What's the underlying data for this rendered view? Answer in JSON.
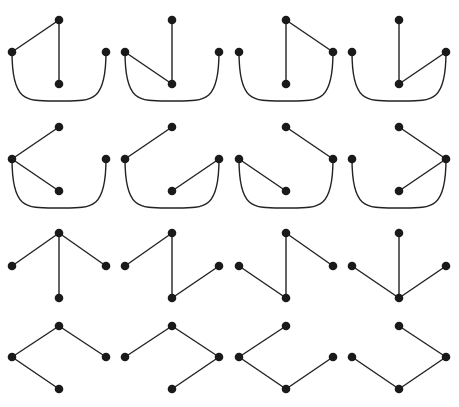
{
  "colors": {
    "edge": "#222222",
    "node": "#1a1a1a",
    "background": "#ffffff"
  },
  "node_radius": 4.3,
  "vertex_labels": [
    "top",
    "left",
    "right",
    "bottom"
  ],
  "panel_offsets_x": [
    0,
    113,
    227,
    340
  ],
  "rows": [
    {
      "y_top": 20,
      "y_side": 52,
      "y_bottom": 84,
      "curve_y": 101
    },
    {
      "y_top": 127,
      "y_side": 159,
      "y_bottom": 191,
      "curve_y": 208
    },
    {
      "y_top": 233,
      "y_side": 266,
      "y_bottom": 298,
      "curve_y": null
    },
    {
      "y_top": 326,
      "y_side": 357,
      "y_bottom": 389,
      "curve_y": null
    }
  ],
  "node_x": {
    "top": 59,
    "left": 12,
    "right": 106,
    "bottom": 59
  },
  "panels": [
    {
      "row": 0,
      "col": 0,
      "edges": [
        [
          "top",
          "left"
        ],
        [
          "top",
          "bottom"
        ],
        [
          "left",
          "right",
          "curve"
        ]
      ]
    },
    {
      "row": 0,
      "col": 1,
      "edges": [
        [
          "top",
          "bottom"
        ],
        [
          "left",
          "bottom"
        ],
        [
          "left",
          "right",
          "curve"
        ]
      ]
    },
    {
      "row": 0,
      "col": 2,
      "edges": [
        [
          "top",
          "bottom"
        ],
        [
          "top",
          "right"
        ],
        [
          "left",
          "right",
          "curve"
        ]
      ]
    },
    {
      "row": 0,
      "col": 3,
      "edges": [
        [
          "top",
          "bottom"
        ],
        [
          "bottom",
          "right"
        ],
        [
          "left",
          "right",
          "curve"
        ]
      ]
    },
    {
      "row": 1,
      "col": 0,
      "edges": [
        [
          "top",
          "left"
        ],
        [
          "left",
          "bottom"
        ],
        [
          "left",
          "right",
          "curve"
        ]
      ]
    },
    {
      "row": 1,
      "col": 1,
      "edges": [
        [
          "top",
          "left"
        ],
        [
          "bottom",
          "right"
        ],
        [
          "left",
          "right",
          "curve"
        ]
      ]
    },
    {
      "row": 1,
      "col": 2,
      "edges": [
        [
          "left",
          "bottom"
        ],
        [
          "top",
          "right"
        ],
        [
          "left",
          "right",
          "curve"
        ]
      ]
    },
    {
      "row": 1,
      "col": 3,
      "edges": [
        [
          "top",
          "right"
        ],
        [
          "bottom",
          "right"
        ],
        [
          "left",
          "right",
          "curve"
        ]
      ]
    },
    {
      "row": 2,
      "col": 0,
      "edges": [
        [
          "top",
          "left"
        ],
        [
          "top",
          "bottom"
        ],
        [
          "top",
          "right"
        ]
      ]
    },
    {
      "row": 2,
      "col": 1,
      "edges": [
        [
          "top",
          "left"
        ],
        [
          "top",
          "bottom"
        ],
        [
          "bottom",
          "right"
        ]
      ]
    },
    {
      "row": 2,
      "col": 2,
      "edges": [
        [
          "left",
          "bottom"
        ],
        [
          "top",
          "bottom"
        ],
        [
          "top",
          "right"
        ]
      ]
    },
    {
      "row": 2,
      "col": 3,
      "edges": [
        [
          "left",
          "bottom"
        ],
        [
          "top",
          "bottom"
        ],
        [
          "bottom",
          "right"
        ]
      ]
    },
    {
      "row": 3,
      "col": 0,
      "edges": [
        [
          "top",
          "left"
        ],
        [
          "top",
          "right"
        ],
        [
          "left",
          "bottom"
        ]
      ]
    },
    {
      "row": 3,
      "col": 1,
      "edges": [
        [
          "top",
          "left"
        ],
        [
          "top",
          "right"
        ],
        [
          "bottom",
          "right"
        ]
      ]
    },
    {
      "row": 3,
      "col": 2,
      "edges": [
        [
          "top",
          "left"
        ],
        [
          "left",
          "bottom"
        ],
        [
          "bottom",
          "right"
        ]
      ]
    },
    {
      "row": 3,
      "col": 3,
      "edges": [
        [
          "top",
          "right"
        ],
        [
          "left",
          "bottom"
        ],
        [
          "bottom",
          "right"
        ]
      ]
    }
  ]
}
